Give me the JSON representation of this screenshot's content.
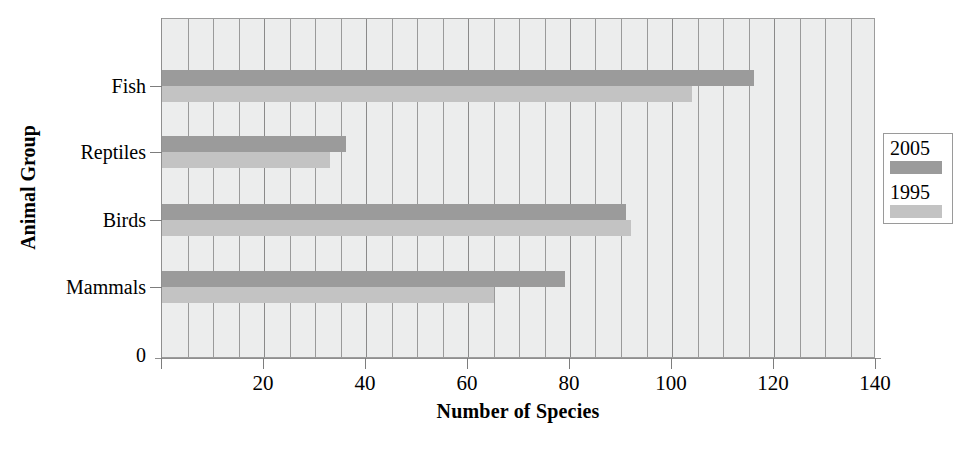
{
  "chart_data": {
    "type": "bar",
    "orientation": "horizontal",
    "title": "",
    "xlabel": "Number of Species",
    "ylabel": "Animal Group",
    "categories": [
      "Mammals",
      "Birds",
      "Reptiles",
      "Fish"
    ],
    "series": [
      {
        "name": "2005",
        "color": "#9b9b9b",
        "values": [
          79,
          91,
          36,
          116
        ]
      },
      {
        "name": "1995",
        "color": "#c3c3c3",
        "values": [
          65,
          92,
          33,
          104
        ]
      }
    ],
    "xlim": [
      0,
      140
    ],
    "xticks": [
      0,
      20,
      40,
      60,
      80,
      100,
      120,
      140
    ],
    "xtick_labels": [
      "0",
      "20",
      "40",
      "60",
      "80",
      "100",
      "120",
      "140"
    ],
    "minor_gridline_step": 5,
    "grid": true,
    "grid_orientation": "vertical",
    "legend_position": "right",
    "plot_background": "#eceded",
    "axis_origin_label": "0"
  },
  "axes": {
    "y_title": "Animal Group",
    "x_title": "Number of Species",
    "y_categories": [
      "Fish",
      "Reptiles",
      "Birds",
      "Mammals"
    ],
    "y_origin": "0",
    "x_ticks": [
      "0",
      "20",
      "40",
      "60",
      "80",
      "100",
      "120",
      "140"
    ]
  },
  "legend": {
    "entries": [
      {
        "label": "2005",
        "color": "#9b9b9b"
      },
      {
        "label": "1995",
        "color": "#c3c3c3"
      }
    ]
  },
  "title_remnant": {
    "text": ""
  }
}
